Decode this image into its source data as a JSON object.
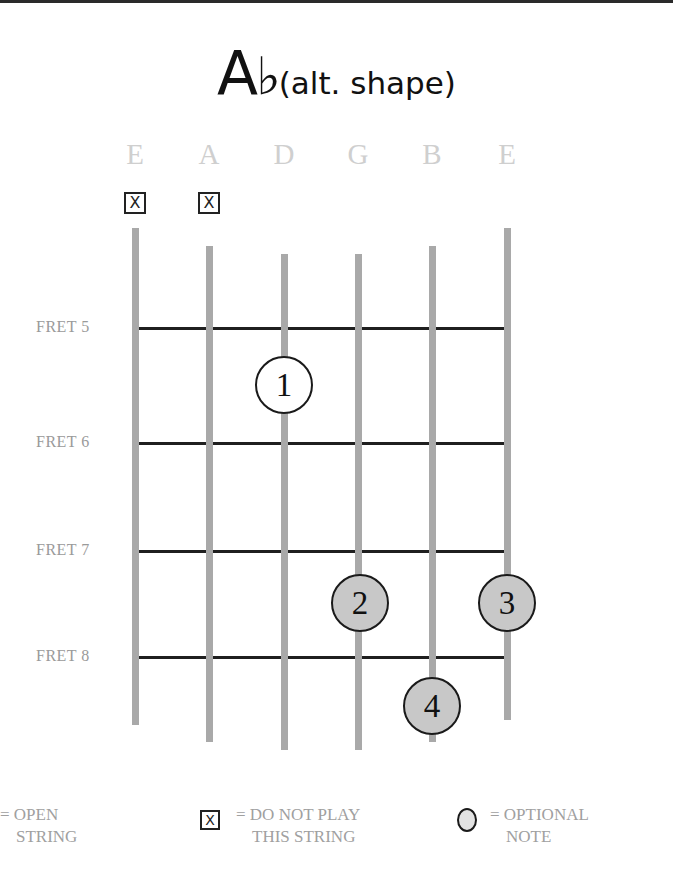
{
  "title": {
    "chord": "Ab",
    "chord_root": "A",
    "chord_accidental": "♭",
    "subtitle": "(alt. shape)"
  },
  "strings": [
    {
      "name": "E",
      "x": 135,
      "top": 228,
      "bottom": 725,
      "muted": true
    },
    {
      "name": "A",
      "x": 209,
      "top": 246,
      "bottom": 742,
      "muted": true
    },
    {
      "name": "D",
      "x": 284,
      "top": 254,
      "bottom": 750,
      "muted": false
    },
    {
      "name": "G",
      "x": 358,
      "top": 254,
      "bottom": 750,
      "muted": false
    },
    {
      "name": "B",
      "x": 432,
      "top": 246,
      "bottom": 742,
      "muted": false
    },
    {
      "name": "E",
      "x": 507,
      "top": 228,
      "bottom": 720,
      "muted": false
    }
  ],
  "mute_symbol": "X",
  "frets": [
    {
      "label": "FRET 5",
      "y": 328
    },
    {
      "label": "FRET 6",
      "y": 443
    },
    {
      "label": "FRET 7",
      "y": 551
    },
    {
      "label": "FRET 8",
      "y": 657
    }
  ],
  "fingers": [
    {
      "number": "1",
      "string": "D",
      "fret": 5,
      "cx": 284,
      "cy": 385,
      "fill": "#ffffff"
    },
    {
      "number": "2",
      "string": "G",
      "fret": 7,
      "cx": 360,
      "cy": 603,
      "fill": "#c8c8c8"
    },
    {
      "number": "3",
      "string": "E",
      "fret": 7,
      "cx": 507,
      "cy": 603,
      "fill": "#c8c8c8"
    },
    {
      "number": "4",
      "string": "B",
      "fret": 8,
      "cx": 432,
      "cy": 706,
      "fill": "#c8c8c8"
    }
  ],
  "legend": {
    "open_line1": "= OPEN",
    "open_line2": "STRING",
    "mute_line1": "= DO NOT PLAY",
    "mute_line2": "THIS STRING",
    "optional_line1": "= OPTIONAL",
    "optional_line2": "NOTE"
  },
  "colors": {
    "string": "#a9a9a9",
    "fret": "#1f1f1f",
    "label": "#cfcfcf",
    "pressed_fill": "#c8c8c8",
    "optional_fill": "#e2e2e2"
  }
}
